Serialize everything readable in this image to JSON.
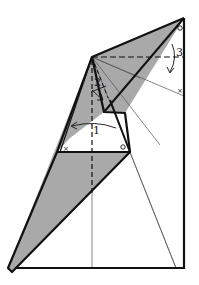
{
  "diagram": {
    "type": "origami-fold-diagram",
    "colors": {
      "background": "#ffffff",
      "paper_shaded": "#a9a9a9",
      "line": "#111111",
      "thin_line": "#555555"
    },
    "steps": [
      {
        "label": "1",
        "description": "valley fold flap to the left"
      },
      {
        "label": "2",
        "description": "fold small flap down"
      },
      {
        "label": "3",
        "description": "valley fold top down along dashed line"
      }
    ],
    "reference_marks": [
      {
        "symbol": "o",
        "position": "top-right corner"
      },
      {
        "symbol": "x",
        "position": "right edge"
      },
      {
        "symbol": "x",
        "position": "triangle base left"
      },
      {
        "symbol": "o",
        "position": "triangle base right"
      }
    ]
  }
}
